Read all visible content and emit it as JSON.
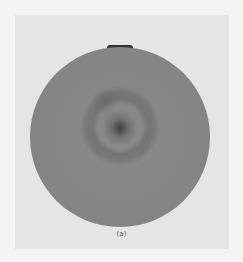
{
  "figure": {
    "caption": "(a)",
    "colors": {
      "background": "#e5e5e3",
      "disk": "#858585",
      "center_spot": "#3e3e3e"
    }
  }
}
